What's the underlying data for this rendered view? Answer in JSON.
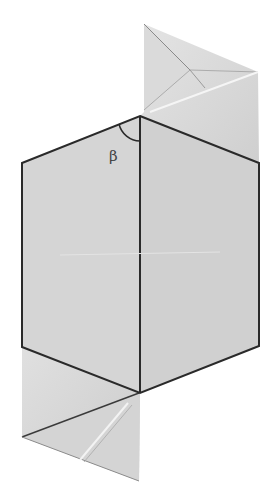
{
  "diagram": {
    "type": "origami-fold-diagram",
    "angle_label": "β",
    "colors": {
      "paper": "#d6d6d6",
      "paper_light": "#e2e2e2",
      "paper_shade": "#c8c8c8",
      "edge": "#2a2a2a",
      "crease": "#f4f4f4",
      "background": "#ffffff"
    },
    "shapes": {
      "hexagon": "140,116 259,163 259,346 140,393 22,347 22,163",
      "top_flap": "144,24 258,72 259,163 140,116 144,110",
      "bottom_flap": "22,347 140,393 139,481 22,437"
    }
  }
}
